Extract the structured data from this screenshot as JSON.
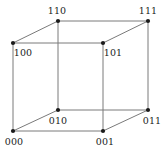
{
  "figure": {
    "type": "cube-graph",
    "background_color": "#ffffff",
    "edge_color": "#7a7a7a",
    "vertex_color": "#1b1b1b",
    "label_color": "#1b1b1b",
    "edge_width": 1,
    "vertex_radius": 2.1
  },
  "vertices": [
    {
      "id": "v110",
      "label": "110",
      "x": 58,
      "y": 21,
      "label_x": 57,
      "label_y": 11
    },
    {
      "id": "v111",
      "label": "111",
      "x": 148,
      "y": 21,
      "label_x": 148,
      "label_y": 11
    },
    {
      "id": "v100",
      "label": "100",
      "x": 13,
      "y": 43,
      "label_x": 23,
      "label_y": 53
    },
    {
      "id": "v101",
      "label": "101",
      "x": 103,
      "y": 43,
      "label_x": 113,
      "label_y": 53
    },
    {
      "id": "v010",
      "label": "010",
      "x": 58,
      "y": 110,
      "label_x": 58,
      "label_y": 121
    },
    {
      "id": "v011",
      "label": "011",
      "x": 148,
      "y": 110,
      "label_x": 152,
      "label_y": 121
    },
    {
      "id": "v000",
      "label": "000",
      "x": 13,
      "y": 131,
      "label_x": 14,
      "label_y": 142
    },
    {
      "id": "v001",
      "label": "001",
      "x": 103,
      "y": 131,
      "label_x": 105,
      "label_y": 142
    }
  ],
  "edges": [
    {
      "id": "e-100-101",
      "from": "100",
      "to": "101",
      "x1": 13,
      "y1": 43,
      "x2": 103,
      "y2": 43
    },
    {
      "id": "e-100-000",
      "from": "100",
      "to": "000",
      "x1": 13,
      "y1": 43,
      "x2": 13,
      "y2": 131
    },
    {
      "id": "e-000-001",
      "from": "000",
      "to": "001",
      "x1": 13,
      "y1": 131,
      "x2": 103,
      "y2": 131
    },
    {
      "id": "e-101-001",
      "from": "101",
      "to": "001",
      "x1": 103,
      "y1": 43,
      "x2": 103,
      "y2": 131
    },
    {
      "id": "e-110-111",
      "from": "110",
      "to": "111",
      "x1": 58,
      "y1": 21,
      "x2": 148,
      "y2": 21
    },
    {
      "id": "e-110-010",
      "from": "110",
      "to": "010",
      "x1": 58,
      "y1": 21,
      "x2": 58,
      "y2": 110
    },
    {
      "id": "e-010-011",
      "from": "010",
      "to": "011",
      "x1": 58,
      "y1": 110,
      "x2": 148,
      "y2": 110
    },
    {
      "id": "e-111-011",
      "from": "111",
      "to": "011",
      "x1": 148,
      "y1": 21,
      "x2": 148,
      "y2": 110
    },
    {
      "id": "e-100-110",
      "from": "100",
      "to": "110",
      "x1": 13,
      "y1": 43,
      "x2": 58,
      "y2": 21
    },
    {
      "id": "e-101-111",
      "from": "101",
      "to": "111",
      "x1": 103,
      "y1": 43,
      "x2": 148,
      "y2": 21
    },
    {
      "id": "e-000-010",
      "from": "000",
      "to": "010",
      "x1": 13,
      "y1": 131,
      "x2": 58,
      "y2": 110
    },
    {
      "id": "e-001-011",
      "from": "001",
      "to": "011",
      "x1": 103,
      "y1": 131,
      "x2": 148,
      "y2": 110
    }
  ]
}
